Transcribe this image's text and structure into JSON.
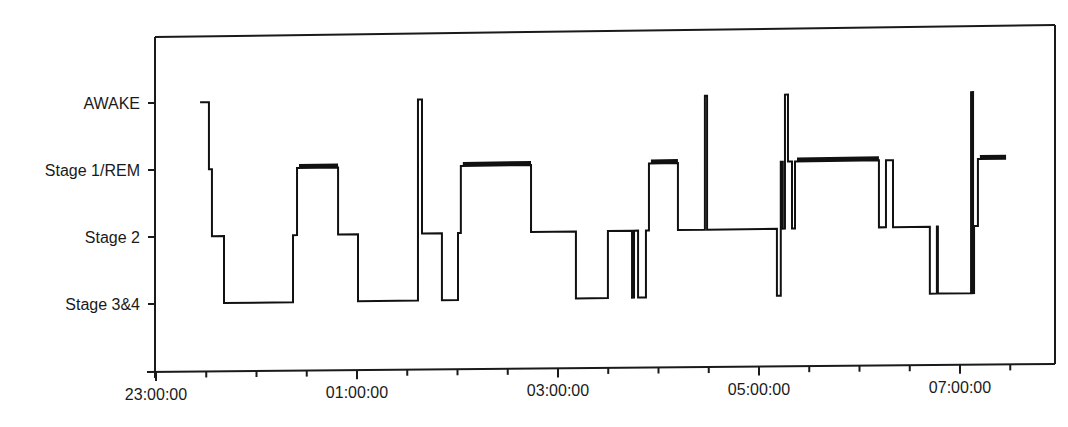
{
  "chart_data": {
    "type": "line",
    "subtype": "step (hypnogram)",
    "title": "",
    "xlabel": "",
    "ylabel": "",
    "x_tick_labels": [
      "23:00:00",
      "01:00:00",
      "03:00:00",
      "05:00:00",
      "07:00:00"
    ],
    "x_range_minutes_from_2300": [
      0,
      540
    ],
    "x_major_tick_interval_minutes": 120,
    "x_minor_tick_interval_minutes": 30,
    "y_categories": [
      "AWAKE",
      "Stage 1/REM",
      "Stage 2",
      "Stage 3&4"
    ],
    "y_stage_index_meaning": {
      "0": "AWAKE",
      "1": "Stage 1/REM",
      "2": "Stage 2",
      "3": "Stage 3&4"
    },
    "grid": false,
    "legend": "none",
    "series": [
      {
        "name": "Sleep stage",
        "points_minutes_stage": [
          [
            28.7,
            0
          ],
          [
            31.6,
            1
          ],
          [
            33.4,
            2
          ],
          [
            40.6,
            3
          ],
          [
            81.8,
            2
          ],
          [
            84.2,
            1
          ],
          [
            108.7,
            2
          ],
          [
            120.6,
            3
          ],
          [
            156.4,
            0
          ],
          [
            158.8,
            2
          ],
          [
            170.7,
            3
          ],
          [
            180.3,
            2
          ],
          [
            182.0,
            1
          ],
          [
            223.9,
            2
          ],
          [
            250.7,
            3
          ],
          [
            269.8,
            2
          ],
          [
            284.2,
            3
          ],
          [
            285.4,
            2
          ],
          [
            287.8,
            3
          ],
          [
            292.5,
            2
          ],
          [
            294.3,
            1
          ],
          [
            311.6,
            2
          ],
          [
            327.7,
            0
          ],
          [
            329.0,
            2
          ],
          [
            370.7,
            3
          ],
          [
            373.0,
            1
          ],
          [
            374.2,
            2
          ],
          [
            375.5,
            0
          ],
          [
            377.3,
            1
          ],
          [
            379.7,
            2
          ],
          [
            381.5,
            1
          ],
          [
            431.6,
            2
          ],
          [
            435.8,
            1
          ],
          [
            440.0,
            2
          ],
          [
            462.0,
            3
          ],
          [
            466.2,
            2
          ],
          [
            466.8,
            3
          ],
          [
            486.6,
            0
          ],
          [
            487.8,
            3
          ],
          [
            488.4,
            2
          ],
          [
            490.7,
            1
          ],
          [
            507.5,
            1
          ]
        ]
      }
    ]
  },
  "axes": {
    "y_labels": [
      "AWAKE",
      "Stage 1/REM",
      "Stage 2",
      "Stage 3&4"
    ],
    "x_labels": [
      "23:00:00",
      "01:00:00",
      "03:00:00",
      "05:00:00",
      "07:00:00"
    ]
  }
}
